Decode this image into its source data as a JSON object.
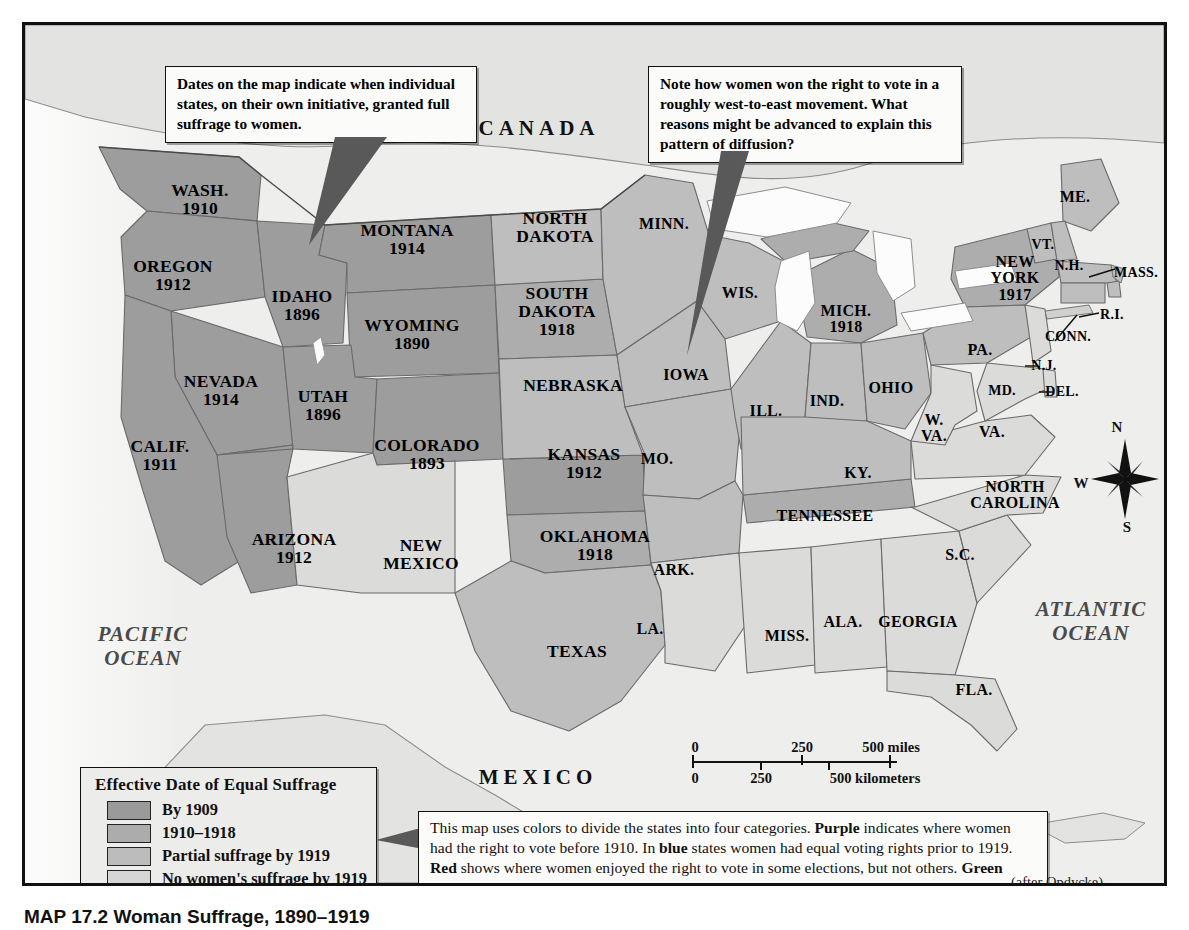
{
  "map": {
    "title_caption": "MAP 17.2  Woman Suffrage, 1890–1919",
    "credit": "(after Opdycke)",
    "countries": [
      {
        "name": "CANADA",
        "x": 514,
        "y": 103
      },
      {
        "name": "MEXICO",
        "x": 513,
        "y": 752
      }
    ],
    "oceans": [
      {
        "name": "PACIFIC\nOCEAN",
        "x": 118,
        "y": 621
      },
      {
        "name": "ATLANTIC\nOCEAN",
        "x": 1066,
        "y": 596
      }
    ],
    "states": [
      {
        "name": "WASH.",
        "year": "1910",
        "x": 175,
        "y": 175,
        "size": "sz-lg",
        "cat": "purple"
      },
      {
        "name": "OREGON",
        "year": "1912",
        "x": 148,
        "y": 251,
        "size": "sz-lg",
        "cat": "purple"
      },
      {
        "name": "IDAHO",
        "year": "1896",
        "x": 277,
        "y": 281,
        "size": "sz-lg",
        "cat": "purple"
      },
      {
        "name": "MONTANA",
        "year": "1914",
        "x": 382,
        "y": 215,
        "size": "sz-lg",
        "cat": "purple"
      },
      {
        "name": "WYOMING",
        "year": "1890",
        "x": 387,
        "y": 310,
        "size": "sz-lg",
        "cat": "purple"
      },
      {
        "name": "NEVADA",
        "year": "1914",
        "x": 196,
        "y": 366,
        "size": "sz-lg",
        "cat": "purple"
      },
      {
        "name": "UTAH",
        "year": "1896",
        "x": 298,
        "y": 381,
        "size": "sz-lg",
        "cat": "purple"
      },
      {
        "name": "COLORADO",
        "year": "1893",
        "x": 402,
        "y": 430,
        "size": "sz-lg",
        "cat": "purple"
      },
      {
        "name": "CALIF.",
        "year": "1911",
        "x": 135,
        "y": 431,
        "size": "sz-lg",
        "cat": "purple"
      },
      {
        "name": "ARIZONA",
        "year": "1912",
        "x": 269,
        "y": 524,
        "size": "sz-lg",
        "cat": "purple"
      },
      {
        "name": "NEW\nMEXICO",
        "year": "",
        "x": 396,
        "y": 530,
        "size": "sz-lg",
        "cat": "green"
      },
      {
        "name": "NORTH\nDAKOTA",
        "year": "",
        "x": 530,
        "y": 203,
        "size": "sz-lg",
        "cat": "red"
      },
      {
        "name": "SOUTH\nDAKOTA",
        "year": "1918",
        "x": 532,
        "y": 287,
        "size": "sz-lg",
        "cat": "blue"
      },
      {
        "name": "NEBRASKA",
        "year": "",
        "x": 548,
        "y": 361,
        "size": "sz-lg",
        "cat": "red"
      },
      {
        "name": "KANSAS",
        "year": "1912",
        "x": 559,
        "y": 439,
        "size": "sz-lg",
        "cat": "purple"
      },
      {
        "name": "OKLAHOMA",
        "year": "1918",
        "x": 570,
        "y": 521,
        "size": "sz-lg",
        "cat": "blue"
      },
      {
        "name": "TEXAS",
        "year": "",
        "x": 552,
        "y": 627,
        "size": "sz-lg",
        "cat": "red"
      },
      {
        "name": "MINN.",
        "year": "",
        "x": 639,
        "y": 199,
        "size": "sz-md",
        "cat": "red"
      },
      {
        "name": "IOWA",
        "year": "",
        "x": 661,
        "y": 350,
        "size": "sz-md",
        "cat": "red"
      },
      {
        "name": "WIS.",
        "year": "",
        "x": 715,
        "y": 268,
        "size": "sz-md",
        "cat": "red"
      },
      {
        "name": "MO.",
        "year": "",
        "x": 632,
        "y": 434,
        "size": "sz-md",
        "cat": "red"
      },
      {
        "name": "ARK.",
        "year": "",
        "x": 649,
        "y": 545,
        "size": "sz-md",
        "cat": "red"
      },
      {
        "name": "LA.",
        "year": "",
        "x": 625,
        "y": 604,
        "size": "sz-md",
        "cat": "green"
      },
      {
        "name": "MICH.",
        "year": "1918",
        "x": 821,
        "y": 294,
        "size": "sz-md",
        "cat": "blue"
      },
      {
        "name": "ILL.",
        "year": "",
        "x": 741,
        "y": 386,
        "size": "sz-md",
        "cat": "red"
      },
      {
        "name": "IND.",
        "year": "",
        "x": 802,
        "y": 376,
        "size": "sz-md",
        "cat": "red"
      },
      {
        "name": "OHIO",
        "year": "",
        "x": 866,
        "y": 363,
        "size": "sz-md",
        "cat": "red"
      },
      {
        "name": "MISS.",
        "year": "",
        "x": 762,
        "y": 611,
        "size": "sz-md",
        "cat": "green"
      },
      {
        "name": "ALA.",
        "year": "",
        "x": 818,
        "y": 597,
        "size": "sz-md",
        "cat": "green"
      },
      {
        "name": "GEORGIA",
        "year": "",
        "x": 893,
        "y": 597,
        "size": "sz-md",
        "cat": "green"
      },
      {
        "name": "TENNESSEE",
        "year": "",
        "x": 800,
        "y": 491,
        "size": "sz-md",
        "cat": "blue"
      },
      {
        "name": "KY.",
        "year": "",
        "x": 833,
        "y": 448,
        "size": "sz-md",
        "cat": "red"
      },
      {
        "name": "W.\nVA.",
        "year": "",
        "x": 909,
        "y": 403,
        "size": "sz-md",
        "cat": "green"
      },
      {
        "name": "VA.",
        "year": "",
        "x": 967,
        "y": 407,
        "size": "sz-md",
        "cat": "green"
      },
      {
        "name": "NORTH\nCAROLINA",
        "year": "",
        "x": 990,
        "y": 470,
        "size": "sz-md",
        "cat": "green"
      },
      {
        "name": "S.C.",
        "year": "",
        "x": 935,
        "y": 530,
        "size": "sz-md",
        "cat": "green"
      },
      {
        "name": "FLA.",
        "year": "",
        "x": 949,
        "y": 665,
        "size": "sz-md",
        "cat": "green"
      },
      {
        "name": "PA.",
        "year": "",
        "x": 955,
        "y": 325,
        "size": "sz-md",
        "cat": "red"
      },
      {
        "name": "MD.",
        "year": "",
        "x": 977,
        "y": 366,
        "size": "sz-xs",
        "cat": "green"
      },
      {
        "name": "DEL.",
        "year": "",
        "x": 1037,
        "y": 367,
        "size": "sz-xs",
        "cat": "green"
      },
      {
        "name": "N.J.",
        "year": "",
        "x": 1019,
        "y": 341,
        "size": "sz-xs",
        "cat": "green"
      },
      {
        "name": "NEW\nYORK",
        "year": "1917",
        "x": 990,
        "y": 253,
        "size": "sz-md",
        "cat": "blue"
      },
      {
        "name": "CONN.",
        "year": "",
        "x": 1043,
        "y": 312,
        "size": "sz-xs",
        "cat": "red"
      },
      {
        "name": "R.I.",
        "year": "",
        "x": 1087,
        "y": 290,
        "size": "sz-xs",
        "cat": "red"
      },
      {
        "name": "MASS.",
        "year": "",
        "x": 1111,
        "y": 248,
        "size": "sz-xs",
        "cat": "red"
      },
      {
        "name": "N.H.",
        "year": "",
        "x": 1044,
        "y": 241,
        "size": "sz-xs",
        "cat": "red"
      },
      {
        "name": "VT.",
        "year": "",
        "x": 1018,
        "y": 220,
        "size": "sz-xs",
        "cat": "red"
      },
      {
        "name": "ME.",
        "year": "",
        "x": 1050,
        "y": 172,
        "size": "sz-md",
        "cat": "red"
      }
    ]
  },
  "callouts": [
    {
      "id": "dates-note",
      "text": "Dates on the map indicate when individual states, on their own initiative, granted full suffrage to women.",
      "x": 140,
      "y": 41,
      "w": 312,
      "h": 72
    },
    {
      "id": "diffusion-note",
      "text": "Note how women won the right to vote in a roughly west-to-east movement. What reasons might be advanced to explain this pattern of diffusion?",
      "x": 623,
      "y": 41,
      "w": 314,
      "h": 90
    }
  ],
  "explanation": {
    "segments": [
      {
        "t": "This map uses colors to divide the states into four categories. ",
        "b": false
      },
      {
        "t": "Purple",
        "b": true
      },
      {
        "t": " indicates where women had the right to vote before 1910. In ",
        "b": false
      },
      {
        "t": "blue",
        "b": true
      },
      {
        "t": " states women had equal voting rights prior to 1919. ",
        "b": false
      },
      {
        "t": "Red",
        "b": true
      },
      {
        "t": " shows where women enjoyed the right to vote in some elections, but not others.  ",
        "b": false
      },
      {
        "t": "Green",
        "b": true
      },
      {
        "t": " indicates the states where women could not vote at all in 1919.",
        "b": false
      }
    ]
  },
  "legend": {
    "title": "Effective Date of Equal Suffrage",
    "items": [
      {
        "label": "By 1909",
        "color": "#9a9a9a",
        "cat": "purple"
      },
      {
        "label": "1910–1918",
        "color": "#acacac",
        "cat": "blue"
      },
      {
        "label": "Partial suffrage by 1919",
        "color": "#bcbcbc",
        "cat": "red"
      },
      {
        "label": "No women's suffrage by 1919",
        "color": "#d6d6d6",
        "cat": "green"
      }
    ]
  },
  "scale": {
    "miles": {
      "ticks": [
        "0",
        "250",
        "500 miles"
      ]
    },
    "kilometers": {
      "ticks": [
        "0",
        "250",
        "500 kilometers"
      ]
    }
  },
  "compass": {
    "n": "N",
    "e": "E",
    "s": "S",
    "w": "W"
  },
  "colors": {
    "purple_swatch": "#9a9a9a",
    "blue_swatch": "#acacac",
    "red_swatch": "#bcbcbc",
    "green_swatch": "#d6d6d6",
    "water": "#f2f2f0",
    "land_outside": "#e4e4e2",
    "border": "#5f5f5f",
    "paper": "#e9e9e7"
  }
}
